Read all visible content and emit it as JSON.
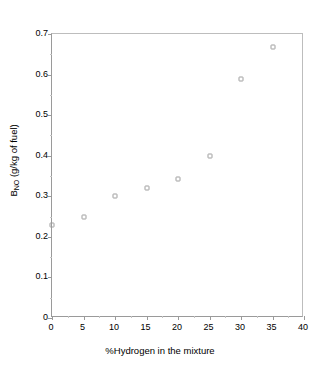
{
  "chart_data": {
    "type": "scatter",
    "title": "",
    "xlabel": "%Hydrogen in the mixture",
    "ylabel_prefix": "B",
    "ylabel_sub": "NO",
    "ylabel_suffix": " (g/kg of fuel)",
    "ylabel": "B NO (g/kg of fuel)",
    "xlim": [
      0,
      40
    ],
    "ylim": [
      0,
      0.7
    ],
    "grid": false,
    "legend": null,
    "marker": "open-square",
    "x": [
      0,
      5,
      10,
      15,
      20,
      25,
      30,
      35
    ],
    "values": [
      0.23,
      0.25,
      0.3,
      0.32,
      0.343,
      0.4,
      0.59,
      0.667
    ],
    "points": [
      {
        "x": 0,
        "y": 0.23
      },
      {
        "x": 5,
        "y": 0.25
      },
      {
        "x": 10,
        "y": 0.3
      },
      {
        "x": 15,
        "y": 0.32
      },
      {
        "x": 20,
        "y": 0.343
      },
      {
        "x": 25,
        "y": 0.4
      },
      {
        "x": 30,
        "y": 0.59
      },
      {
        "x": 35,
        "y": 0.667
      }
    ],
    "xticks": [
      0,
      5,
      10,
      15,
      20,
      25,
      30,
      35,
      40
    ],
    "xtick_labels": [
      "0",
      "5",
      "10",
      "15",
      "20",
      "25",
      "30",
      "35",
      "40"
    ],
    "yticks": [
      0,
      0.1,
      0.2,
      0.3,
      0.4,
      0.5,
      0.6,
      0.7
    ],
    "ytick_labels": [
      "0",
      "0.1",
      "0.2",
      "0.3",
      "0.4",
      "0.5",
      "0.6",
      "0.7"
    ],
    "axis_color": "#9a9a9a",
    "marker_color": "#9d9d9d",
    "background": "#ffffff"
  }
}
